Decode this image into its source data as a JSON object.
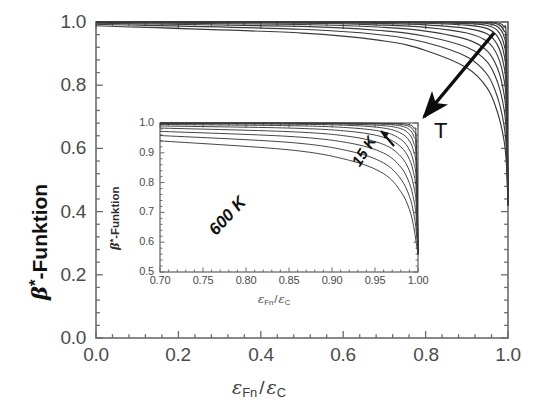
{
  "chart_data": {
    "type": "line",
    "title": "",
    "xlabel": "ε_Fn/ε_C",
    "ylabel": "β*-Funktion",
    "xlim": [
      0.0,
      1.0
    ],
    "ylim": [
      0.0,
      1.0
    ],
    "grid": false,
    "legend_position": "none",
    "x_ticks": [
      "0.0",
      "0.2",
      "0.4",
      "0.6",
      "0.8",
      "1.0"
    ],
    "y_ticks": [
      "0.0",
      "0.2",
      "0.4",
      "0.6",
      "0.8",
      "1.0"
    ],
    "x_tick_values": [
      0.0,
      0.2,
      0.4,
      0.6,
      0.8,
      1.0
    ],
    "y_tick_values": [
      0.0,
      0.2,
      0.4,
      0.6,
      0.8,
      1.0
    ],
    "annotations": [
      {
        "text": "T",
        "meaning": "temperature-increases-direction",
        "arrow": "down-left"
      }
    ],
    "series": [
      {
        "name": "15 K",
        "temperature_K": 15,
        "x": [
          0.0,
          0.5,
          0.7,
          0.8,
          0.9,
          0.95,
          0.975,
          0.99,
          0.996,
          1.0
        ],
        "y": [
          1.0,
          1.0,
          1.0,
          1.0,
          1.0,
          0.999,
          0.997,
          0.985,
          0.93,
          0.42
        ]
      },
      {
        "name": "20 K",
        "temperature_K": 20,
        "x": [
          0.0,
          0.5,
          0.7,
          0.8,
          0.9,
          0.95,
          0.975,
          0.99,
          0.996,
          1.0
        ],
        "y": [
          1.0,
          1.0,
          1.0,
          1.0,
          0.999,
          0.998,
          0.993,
          0.973,
          0.905,
          0.42
        ]
      },
      {
        "name": "30 K",
        "temperature_K": 30,
        "x": [
          0.0,
          0.5,
          0.7,
          0.8,
          0.9,
          0.95,
          0.975,
          0.99,
          0.996,
          1.0
        ],
        "y": [
          1.0,
          1.0,
          1.0,
          0.999,
          0.998,
          0.995,
          0.985,
          0.955,
          0.875,
          0.42
        ]
      },
      {
        "name": "45 K",
        "temperature_K": 45,
        "x": [
          0.0,
          0.5,
          0.7,
          0.8,
          0.9,
          0.95,
          0.975,
          0.99,
          0.996,
          1.0
        ],
        "y": [
          1.0,
          1.0,
          0.999,
          0.998,
          0.995,
          0.989,
          0.972,
          0.93,
          0.845,
          0.42
        ]
      },
      {
        "name": "70 K",
        "temperature_K": 70,
        "x": [
          0.0,
          0.5,
          0.7,
          0.8,
          0.9,
          0.95,
          0.975,
          0.99,
          0.996,
          1.0
        ],
        "y": [
          1.0,
          0.999,
          0.998,
          0.996,
          0.99,
          0.979,
          0.953,
          0.9,
          0.81,
          0.42
        ]
      },
      {
        "name": "110 K",
        "temperature_K": 110,
        "x": [
          0.0,
          0.5,
          0.7,
          0.8,
          0.9,
          0.95,
          0.975,
          0.99,
          0.996,
          1.0
        ],
        "y": [
          1.0,
          0.998,
          0.995,
          0.991,
          0.98,
          0.962,
          0.926,
          0.862,
          0.772,
          0.42
        ]
      },
      {
        "name": "160 K",
        "temperature_K": 160,
        "x": [
          0.0,
          0.5,
          0.7,
          0.8,
          0.9,
          0.95,
          0.975,
          0.99,
          0.996,
          1.0
        ],
        "y": [
          0.999,
          0.996,
          0.99,
          0.983,
          0.965,
          0.938,
          0.892,
          0.82,
          0.732,
          0.42
        ]
      },
      {
        "name": "230 K",
        "temperature_K": 230,
        "x": [
          0.0,
          0.5,
          0.7,
          0.8,
          0.9,
          0.95,
          0.975,
          0.99,
          0.996,
          1.0
        ],
        "y": [
          0.998,
          0.992,
          0.983,
          0.971,
          0.945,
          0.908,
          0.852,
          0.775,
          0.69,
          0.42
        ]
      },
      {
        "name": "320 K",
        "temperature_K": 320,
        "x": [
          0.0,
          0.5,
          0.7,
          0.8,
          0.9,
          0.95,
          0.975,
          0.99,
          0.996,
          1.0
        ],
        "y": [
          0.996,
          0.986,
          0.972,
          0.955,
          0.92,
          0.873,
          0.808,
          0.727,
          0.645,
          0.42
        ]
      },
      {
        "name": "440 K",
        "temperature_K": 440,
        "x": [
          0.0,
          0.5,
          0.7,
          0.8,
          0.9,
          0.95,
          0.975,
          0.99,
          0.996,
          1.0
        ],
        "y": [
          0.993,
          0.977,
          0.958,
          0.935,
          0.89,
          0.833,
          0.76,
          0.676,
          0.598,
          0.42
        ]
      },
      {
        "name": "600 K",
        "temperature_K": 600,
        "x": [
          0.0,
          0.5,
          0.7,
          0.8,
          0.9,
          0.95,
          0.975,
          0.99,
          0.996,
          1.0
        ],
        "y": [
          0.988,
          0.965,
          0.94,
          0.91,
          0.855,
          0.79,
          0.712,
          0.628,
          0.553,
          0.42
        ]
      }
    ],
    "inset": {
      "type": "line",
      "xlabel": "ε_Fn/ε_C",
      "ylabel": "β*-Funktion",
      "xlim": [
        0.7,
        1.0
      ],
      "ylim": [
        0.5,
        1.0
      ],
      "grid": false,
      "x_ticks": [
        "0.70",
        "0.75",
        "0.80",
        "0.85",
        "0.90",
        "0.95",
        "1.00"
      ],
      "y_ticks": [
        "0.5",
        "0.6",
        "0.7",
        "0.8",
        "0.9",
        "1.0"
      ],
      "x_tick_values": [
        0.7,
        0.75,
        0.8,
        0.85,
        0.9,
        0.95,
        1.0
      ],
      "y_tick_values": [
        0.5,
        0.6,
        0.7,
        0.8,
        0.9,
        1.0
      ],
      "annotations": [
        {
          "text": "15 K",
          "position": "top-right"
        },
        {
          "text": "600 K",
          "position": "middle-center"
        }
      ],
      "series": [
        {
          "name": "15 K",
          "temperature_K": 15,
          "x": [
            0.7,
            0.85,
            0.92,
            0.96,
            0.98,
            0.99,
            0.995,
            0.998,
            1.0
          ],
          "y": [
            1.0,
            1.0,
            1.0,
            0.999,
            0.998,
            0.994,
            0.983,
            0.94,
            0.56
          ]
        },
        {
          "name": "20 K",
          "temperature_K": 20,
          "x": [
            0.7,
            0.85,
            0.92,
            0.96,
            0.98,
            0.99,
            0.995,
            0.998,
            1.0
          ],
          "y": [
            1.0,
            1.0,
            0.999,
            0.998,
            0.995,
            0.988,
            0.972,
            0.925,
            0.56
          ]
        },
        {
          "name": "30 K",
          "temperature_K": 30,
          "x": [
            0.7,
            0.85,
            0.92,
            0.96,
            0.98,
            0.99,
            0.995,
            0.998,
            1.0
          ],
          "y": [
            1.0,
            0.999,
            0.998,
            0.996,
            0.99,
            0.978,
            0.955,
            0.902,
            0.56
          ]
        },
        {
          "name": "45 K",
          "temperature_K": 45,
          "x": [
            0.7,
            0.85,
            0.92,
            0.96,
            0.98,
            0.99,
            0.995,
            0.998,
            1.0
          ],
          "y": [
            0.999,
            0.998,
            0.996,
            0.991,
            0.981,
            0.962,
            0.932,
            0.875,
            0.56
          ]
        },
        {
          "name": "70 K",
          "temperature_K": 70,
          "x": [
            0.7,
            0.85,
            0.92,
            0.96,
            0.98,
            0.99,
            0.995,
            0.998,
            1.0
          ],
          "y": [
            0.998,
            0.996,
            0.992,
            0.983,
            0.966,
            0.94,
            0.903,
            0.843,
            0.56
          ]
        },
        {
          "name": "110 K",
          "temperature_K": 110,
          "x": [
            0.7,
            0.85,
            0.92,
            0.96,
            0.98,
            0.99,
            0.995,
            0.998,
            1.0
          ],
          "y": [
            0.995,
            0.991,
            0.984,
            0.97,
            0.945,
            0.91,
            0.867,
            0.805,
            0.56
          ]
        },
        {
          "name": "160 K",
          "temperature_K": 160,
          "x": [
            0.7,
            0.85,
            0.92,
            0.96,
            0.98,
            0.99,
            0.995,
            0.998,
            1.0
          ],
          "y": [
            0.99,
            0.983,
            0.972,
            0.952,
            0.92,
            0.878,
            0.83,
            0.768,
            0.56
          ]
        },
        {
          "name": "230 K",
          "temperature_K": 230,
          "x": [
            0.7,
            0.85,
            0.92,
            0.96,
            0.98,
            0.99,
            0.995,
            0.998,
            1.0
          ],
          "y": [
            0.983,
            0.971,
            0.955,
            0.928,
            0.888,
            0.84,
            0.788,
            0.726,
            0.56
          ]
        },
        {
          "name": "320 K",
          "temperature_K": 320,
          "x": [
            0.7,
            0.85,
            0.92,
            0.96,
            0.98,
            0.99,
            0.995,
            0.998,
            1.0
          ],
          "y": [
            0.972,
            0.955,
            0.933,
            0.899,
            0.852,
            0.798,
            0.743,
            0.682,
            0.56
          ]
        },
        {
          "name": "440 K",
          "temperature_K": 440,
          "x": [
            0.7,
            0.85,
            0.92,
            0.96,
            0.98,
            0.99,
            0.995,
            0.998,
            1.0
          ],
          "y": [
            0.958,
            0.935,
            0.906,
            0.866,
            0.812,
            0.754,
            0.697,
            0.637,
            0.56
          ]
        },
        {
          "name": "600 K",
          "temperature_K": 600,
          "x": [
            0.7,
            0.85,
            0.92,
            0.96,
            0.98,
            0.99,
            0.995,
            0.998,
            1.0
          ],
          "y": [
            0.94,
            0.91,
            0.875,
            0.83,
            0.77,
            0.71,
            0.652,
            0.596,
            0.56
          ]
        }
      ]
    }
  },
  "main_axis": {
    "y_label_prefix": "β",
    "y_label_star": "*",
    "y_label_suffix": "-Funktion",
    "x_label_eps": "ε",
    "x_label_sub1": "Fn",
    "x_label_slash": "/",
    "x_label_eps2": "ε",
    "x_label_sub2": "C"
  },
  "inset_axis": {
    "y_label_prefix": "β",
    "y_label_star": "*",
    "y_label_suffix": "-Funktion",
    "x_label_eps": "ε",
    "x_label_sub1": "Fn",
    "x_label_slash": "/",
    "x_label_eps2": "ε",
    "x_label_sub2": "C"
  },
  "annotations": {
    "temperature_arrow_label": "T",
    "inset_low_temp": "15 K",
    "inset_high_temp": "600 K"
  },
  "colors": {
    "curve": "#3a3a3a",
    "axis": "#5a5a5a",
    "text": "#222222",
    "background": "#ffffff"
  }
}
